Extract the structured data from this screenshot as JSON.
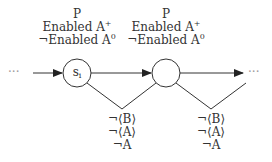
{
  "diagram": {
    "states": [
      {
        "label": "s",
        "label_sub": "i",
        "annotations": [
          "P",
          "Enabled A",
          "¬Enabled A"
        ],
        "annotation_sups": [
          "",
          "+",
          "0"
        ]
      },
      {
        "label": "",
        "label_sub": "",
        "annotations": [
          "P",
          "Enabled A",
          "¬Enabled A"
        ],
        "annotation_sups": [
          "",
          "+",
          "0"
        ]
      }
    ],
    "branch_labels": [
      [
        "¬⟨B⟩",
        "¬⟨A⟩",
        "¬A"
      ],
      [
        "¬⟨B⟩",
        "¬⟨A⟩",
        "¬A"
      ]
    ],
    "ellipsis_left": "···",
    "ellipsis_right": "···",
    "colors": {
      "stroke": "#333333",
      "background": "#ffffff"
    }
  }
}
